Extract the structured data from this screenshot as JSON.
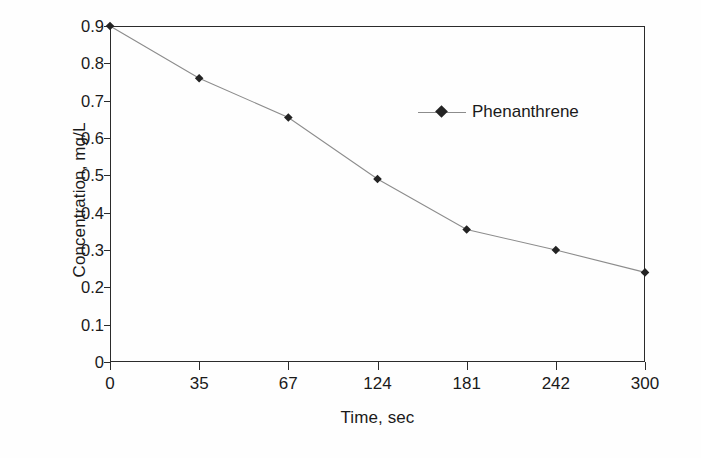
{
  "chart_data": {
    "type": "line",
    "title": "",
    "subtitle": "",
    "xlabel": "Time, sec",
    "ylabel": "Concentration, mg/L",
    "categories": [
      "0",
      "35",
      "67",
      "124",
      "181",
      "242",
      "300"
    ],
    "x_tick_labels": [
      "0",
      "35",
      "67",
      "124",
      "181",
      "242",
      "300"
    ],
    "y_tick_labels": [
      "0",
      "0.1",
      "0.2",
      "0.3",
      "0.4",
      "0.5",
      "0.6",
      "0.7",
      "0.8",
      "0.9"
    ],
    "y_ticks": [
      0,
      0.1,
      0.2,
      0.3,
      0.4,
      0.5,
      0.6,
      0.7,
      0.8,
      0.9
    ],
    "ylim": [
      0,
      0.9
    ],
    "grid": false,
    "frame": true,
    "legend_position": "inside-upper-center-right",
    "series": [
      {
        "name": "Phenanthrene",
        "marker": "diamond",
        "marker_color": "#232323",
        "line_color": "#8c8c8c",
        "values": [
          0.9,
          0.76,
          0.655,
          0.49,
          0.355,
          0.3,
          0.24
        ]
      }
    ]
  },
  "legend": {
    "entries": [
      {
        "label": "Phenanthrene"
      }
    ]
  },
  "axes": {
    "x_title": "Time, sec",
    "y_title": "Concentration, mg/L"
  },
  "colors": {
    "axis": "#2b2b2b",
    "marker": "#232323",
    "line": "#8c8c8c",
    "text": "#1a1a1a",
    "background": "#fefefe"
  }
}
